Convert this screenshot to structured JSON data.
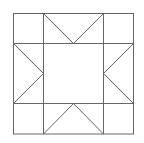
{
  "diagram": {
    "type": "quilt-block",
    "stroke_color": "#666666",
    "background": "#ffffff",
    "bounds": {
      "x0": 13,
      "y0": 13,
      "x1": 133,
      "y1": 134
    },
    "grid_lines": {
      "x": [
        13,
        43,
        103,
        133
      ],
      "y": [
        13,
        43,
        104,
        134
      ]
    },
    "center": {
      "x": 73,
      "y": 73
    }
  }
}
